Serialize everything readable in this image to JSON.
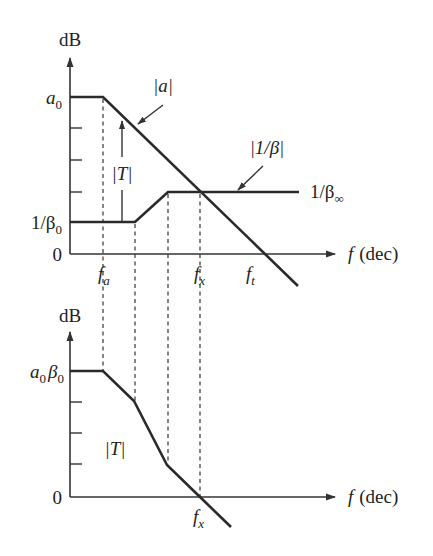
{
  "top_plot": {
    "y_axis_label": "dB",
    "x_axis_label_var": "f",
    "x_axis_label_unit": "(dec)",
    "y_labels": {
      "a0": {
        "base": "a",
        "sub": "0"
      },
      "inv_beta0": {
        "base": "1/β",
        "sub": "0"
      },
      "zero": "0"
    },
    "x_labels": {
      "fa": {
        "base": "f",
        "sub": "a"
      },
      "fx": {
        "base": "f",
        "sub": "x"
      },
      "ft": {
        "base": "f",
        "sub": "t"
      }
    },
    "curve_labels": {
      "a_mag": "|a|",
      "inv_beta_mag": "|1/β|",
      "T_mag": "|T|",
      "inv_beta_inf": {
        "base": "1/β",
        "sub": "∞"
      }
    }
  },
  "bottom_plot": {
    "y_axis_label": "dB",
    "x_axis_label_var": "f",
    "x_axis_label_unit": "(dec)",
    "y_labels": {
      "a0beta0": {
        "a": "a",
        "a_sub": "0",
        "b": "β",
        "b_sub": "0"
      },
      "zero": "0"
    },
    "x_labels": {
      "fx": {
        "base": "f",
        "sub": "x"
      }
    },
    "curve_labels": {
      "T_mag": "|T|"
    }
  },
  "colors": {
    "line": "#2a2a2a",
    "background": "#ffffff"
  }
}
